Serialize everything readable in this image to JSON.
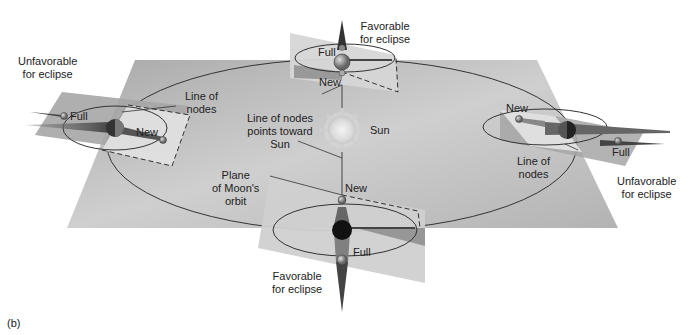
{
  "figure": {
    "panel_label": "(b)"
  },
  "labels": {
    "sun": "Sun",
    "line_of_nodes_points_toward_sun": [
      "Line of nodes",
      "points toward",
      "Sun"
    ],
    "plane_of_moons_orbit": [
      "Plane",
      "of Moon's",
      "orbit"
    ]
  },
  "positions": [
    {
      "id": "top",
      "status": [
        "Favorable",
        "for eclipse"
      ],
      "full_label": "Full",
      "new_label": "New"
    },
    {
      "id": "left",
      "status": [
        "Unfavorable",
        "for eclipse"
      ],
      "full_label": "Full",
      "new_label": "New",
      "line_of_nodes": [
        "Line of",
        "nodes"
      ]
    },
    {
      "id": "right",
      "status": [
        "Unfavorable",
        "for eclipse"
      ],
      "full_label": "Full",
      "new_label": "New",
      "line_of_nodes": [
        "Line of",
        "nodes"
      ]
    },
    {
      "id": "bottom",
      "status": [
        "Favorable",
        "for eclipse"
      ],
      "full_label": "Full",
      "new_label": "New"
    }
  ],
  "colors": {
    "ecliptic_plane": "#b9b9b9",
    "moon_plane": "#d6d6d6",
    "shadow": "#555555",
    "sun": "#e6e6e6",
    "line": "#333333"
  }
}
